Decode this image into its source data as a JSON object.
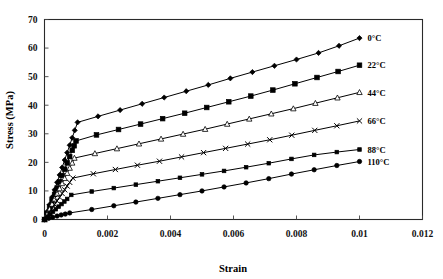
{
  "chart_data": {
    "type": "line",
    "title": "",
    "xlabel": "Strain",
    "ylabel": "Stress (MPa)",
    "xlim": [
      0,
      0.012
    ],
    "ylim": [
      0,
      70
    ],
    "xticks": [
      0,
      0.002,
      0.004,
      0.006,
      0.008,
      0.01,
      0.012
    ],
    "xtick_labels": [
      "0",
      "0.002",
      "0.004",
      "0.006",
      "0.008",
      "0.01",
      "0.012"
    ],
    "yticks": [
      0,
      10,
      20,
      30,
      40,
      50,
      60,
      70
    ],
    "ytick_labels": [
      "0",
      "10",
      "20",
      "30",
      "40",
      "50",
      "60",
      "70"
    ],
    "grid": false,
    "legend": "inline-right-end-labels",
    "series": [
      {
        "name": "0°C",
        "label": "0°C",
        "marker": "diamond",
        "color": "#000000",
        "knee": {
          "x": 0.00105,
          "y": 34.0
        },
        "end": {
          "x": 0.01,
          "y": 63.5
        },
        "x": [
          0.0,
          8e-05,
          0.00016,
          0.00024,
          0.00032,
          0.0004,
          0.00048,
          0.00056,
          0.00064,
          0.00072,
          0.0008,
          0.00088,
          0.00096,
          0.00105,
          0.0017,
          0.0024,
          0.0031,
          0.0038,
          0.0045,
          0.0052,
          0.0059,
          0.0066,
          0.0073,
          0.008,
          0.0087,
          0.00935,
          0.01
        ],
        "y": [
          0.0,
          2.6,
          5.2,
          7.8,
          10.4,
          13.0,
          15.6,
          18.2,
          20.8,
          23.4,
          26.0,
          28.6,
          31.2,
          34.0,
          36.1,
          38.3,
          40.5,
          42.7,
          44.9,
          47.1,
          49.4,
          51.6,
          53.8,
          56.0,
          58.3,
          60.8,
          63.5
        ]
      },
      {
        "name": "22°C",
        "label": "22°C",
        "marker": "square",
        "color": "#000000",
        "knee": {
          "x": 0.001,
          "y": 27.5
        },
        "end": {
          "x": 0.01,
          "y": 54.0
        },
        "x": [
          0.0,
          8e-05,
          0.00016,
          0.00024,
          0.00032,
          0.0004,
          0.00048,
          0.00056,
          0.00064,
          0.00072,
          0.0008,
          0.00088,
          0.00094,
          0.001,
          0.00165,
          0.00235,
          0.00305,
          0.00375,
          0.00445,
          0.00515,
          0.00585,
          0.00655,
          0.00725,
          0.00795,
          0.00865,
          0.00932,
          0.01
        ],
        "y": [
          0.0,
          2.2,
          4.4,
          6.6,
          8.8,
          11.0,
          13.2,
          15.4,
          17.6,
          19.8,
          22.0,
          24.2,
          25.8,
          27.5,
          29.6,
          31.5,
          33.4,
          35.3,
          37.2,
          39.2,
          41.2,
          43.2,
          45.3,
          47.5,
          49.7,
          51.8,
          54.0
        ]
      },
      {
        "name": "44°C",
        "label": "44°C",
        "marker": "triangle",
        "color": "#000000",
        "knee": {
          "x": 0.00095,
          "y": 21.5
        },
        "end": {
          "x": 0.01,
          "y": 44.5
        },
        "x": [
          0.0,
          8e-05,
          0.00016,
          0.00024,
          0.00032,
          0.0004,
          0.00048,
          0.00056,
          0.00064,
          0.00072,
          0.0008,
          0.00088,
          0.00095,
          0.0016,
          0.0023,
          0.003,
          0.0037,
          0.0044,
          0.0051,
          0.0058,
          0.0065,
          0.0072,
          0.0079,
          0.0086,
          0.0093,
          0.01
        ],
        "y": [
          0.0,
          1.8,
          3.6,
          5.4,
          7.2,
          9.0,
          10.8,
          12.6,
          14.4,
          16.2,
          18.0,
          19.8,
          21.5,
          23.1,
          24.8,
          26.5,
          28.2,
          29.9,
          31.6,
          33.4,
          35.2,
          37.0,
          38.8,
          40.7,
          42.6,
          44.5
        ]
      },
      {
        "name": "66°C",
        "label": "66°C",
        "marker": "x",
        "color": "#000000",
        "knee": {
          "x": 0.0009,
          "y": 14.5
        },
        "end": {
          "x": 0.01,
          "y": 34.5
        },
        "x": [
          0.0,
          8e-05,
          0.00016,
          0.00024,
          0.00032,
          0.0004,
          0.00048,
          0.00056,
          0.00064,
          0.00072,
          0.0008,
          0.0009,
          0.00155,
          0.00225,
          0.00295,
          0.00365,
          0.00435,
          0.00505,
          0.00575,
          0.00645,
          0.00715,
          0.00785,
          0.00858,
          0.00928,
          0.01
        ],
        "y": [
          0.0,
          1.3,
          2.6,
          3.9,
          5.2,
          6.5,
          7.8,
          9.1,
          10.4,
          11.7,
          13.0,
          14.5,
          16.0,
          17.5,
          19.0,
          20.4,
          21.9,
          23.4,
          24.9,
          26.4,
          27.9,
          29.5,
          31.2,
          32.8,
          34.5
        ]
      },
      {
        "name": "88°C",
        "label": "88°C",
        "marker": "small-square",
        "color": "#000000",
        "knee": {
          "x": 0.00085,
          "y": 8.6
        },
        "end": {
          "x": 0.01,
          "y": 24.5
        },
        "x": [
          0.0,
          9e-05,
          0.00018,
          0.00027,
          0.00036,
          0.00045,
          0.00054,
          0.00063,
          0.00072,
          0.00085,
          0.0015,
          0.0022,
          0.0029,
          0.0036,
          0.0043,
          0.005,
          0.0057,
          0.0064,
          0.00712,
          0.00784,
          0.00856,
          0.00928,
          0.01
        ],
        "y": [
          0.0,
          0.9,
          1.8,
          2.7,
          3.6,
          4.5,
          5.4,
          6.3,
          7.2,
          8.6,
          9.8,
          11.0,
          12.2,
          13.4,
          14.6,
          15.8,
          17.0,
          18.3,
          19.7,
          21.2,
          22.6,
          23.6,
          24.5
        ]
      },
      {
        "name": "110°C",
        "label": "110°C",
        "marker": "circle",
        "color": "#000000",
        "knee": {
          "x": 0.0008,
          "y": 2.3
        },
        "end": {
          "x": 0.01,
          "y": 20.3
        },
        "x": [
          0.0,
          0.00013,
          0.00026,
          0.0004,
          0.00053,
          0.00066,
          0.0008,
          0.0015,
          0.0022,
          0.0029,
          0.0036,
          0.0043,
          0.005,
          0.0057,
          0.0064,
          0.00712,
          0.00784,
          0.00856,
          0.00928,
          0.01
        ],
        "y": [
          0.0,
          0.4,
          0.8,
          1.2,
          1.6,
          1.9,
          2.3,
          3.5,
          4.8,
          6.1,
          7.4,
          8.7,
          10.0,
          11.4,
          12.8,
          14.3,
          15.9,
          17.4,
          18.9,
          20.3
        ]
      }
    ]
  },
  "axes": {
    "xlabel": "Strain",
    "ylabel": "Stress (MPa)"
  }
}
